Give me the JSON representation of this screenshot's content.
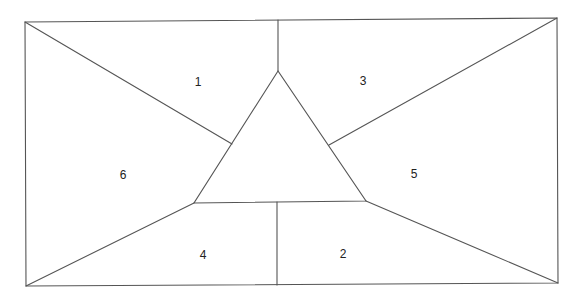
{
  "diagram": {
    "type": "region-partition",
    "stroke_color": "#555555",
    "background": "#ffffff",
    "regions": [
      {
        "id": "1",
        "label": "1",
        "x": 198,
        "y": 83
      },
      {
        "id": "3",
        "label": "3",
        "x": 363,
        "y": 82
      },
      {
        "id": "6",
        "label": "6",
        "x": 123,
        "y": 176
      },
      {
        "id": "5",
        "label": "5",
        "x": 414,
        "y": 175
      },
      {
        "id": "4",
        "label": "4",
        "x": 203,
        "y": 256
      },
      {
        "id": "2",
        "label": "2",
        "x": 343,
        "y": 255
      }
    ]
  }
}
